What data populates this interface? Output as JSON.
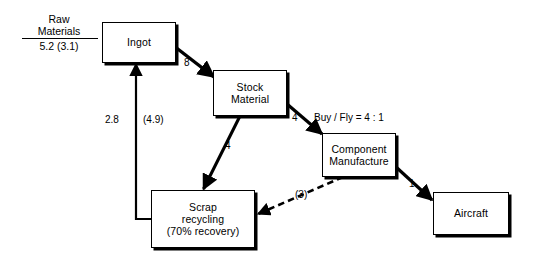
{
  "diagram": {
    "background": "#ffffff",
    "ink": "#000000",
    "raw_materials": {
      "label": "Raw\nMaterials",
      "value": "5.2 (3.1)"
    },
    "nodes": [
      {
        "id": "ingot",
        "label": "Ingot"
      },
      {
        "id": "stock-material",
        "label": "Stock\nMaterial"
      },
      {
        "id": "component-manufacture",
        "label": "Component\nManufacture"
      },
      {
        "id": "aircraft",
        "label": "Aircraft"
      },
      {
        "id": "scrap-recycling",
        "label": "Scrap\nrecycling\n(70% recovery)"
      }
    ],
    "edges": [
      {
        "id": "ingot-to-stock",
        "label": "8",
        "style": "solid"
      },
      {
        "id": "stock-to-component",
        "label": "4",
        "style": "solid"
      },
      {
        "id": "stock-to-scrap",
        "label": "4",
        "style": "solid"
      },
      {
        "id": "component-to-aircraft",
        "label": "1",
        "style": "solid"
      },
      {
        "id": "component-to-scrap",
        "label": "(3)",
        "style": "dashed"
      },
      {
        "id": "scrap-to-ingot-a",
        "label": "2.8",
        "style": "solid"
      },
      {
        "id": "scrap-to-ingot-b",
        "label": "(4.9)",
        "style": "solid"
      }
    ],
    "annotations": [
      {
        "id": "buy-fly-ratio",
        "label": "Buy / Fly = 4 : 1"
      }
    ]
  }
}
